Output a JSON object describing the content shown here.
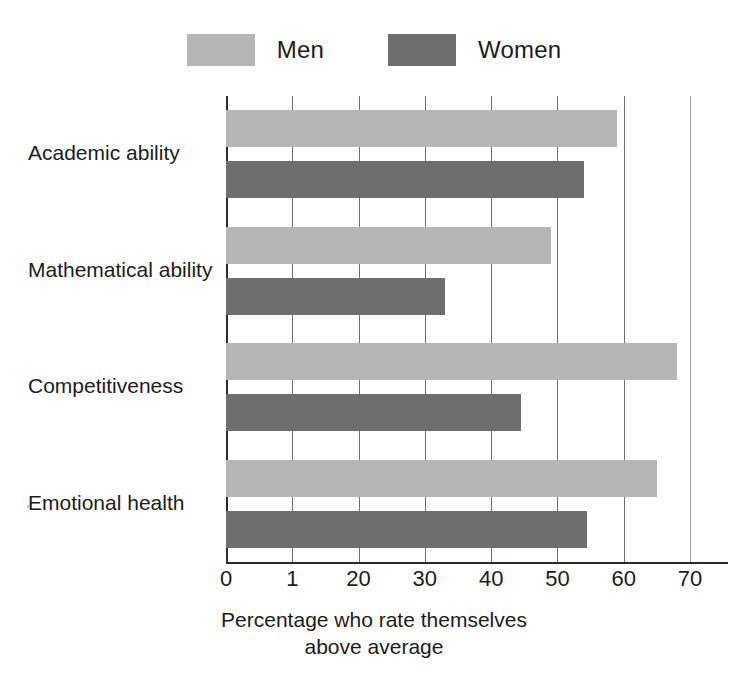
{
  "chart_data": {
    "type": "bar",
    "orientation": "horizontal",
    "title": "",
    "xlabel": "Percentage who rate themselves above average",
    "xlabel_lines": [
      "Percentage who rate themselves",
      "above average"
    ],
    "ylabel": "",
    "categories": [
      "Academic ability",
      "Mathematical ability",
      "Competitiveness",
      "Emotional health"
    ],
    "series": [
      {
        "name": "Men",
        "color": "#b6b6b6",
        "values": [
          59,
          49,
          68,
          65
        ]
      },
      {
        "name": "Women",
        "color": "#6e6e6e",
        "values": [
          54,
          33,
          44.5,
          54.5
        ]
      }
    ],
    "xlim": [
      0,
      70
    ],
    "xticks": [
      0,
      10,
      20,
      30,
      40,
      50,
      60,
      70
    ],
    "xtick_labels": [
      "0",
      "1",
      "20",
      "30",
      "40",
      "50",
      "60",
      "70"
    ],
    "grid": true,
    "grid_axis": "x",
    "legend_position": "top-center"
  },
  "legend": {
    "entries": [
      {
        "label": "Men",
        "swatch": "men-swatch"
      },
      {
        "label": "Women",
        "swatch": "women-swatch"
      }
    ]
  }
}
